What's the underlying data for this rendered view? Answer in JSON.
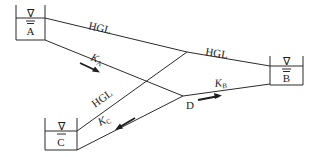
{
  "diagram": {
    "reservoirs": [
      {
        "id": "A",
        "label": "A"
      },
      {
        "id": "B",
        "label": "B"
      },
      {
        "id": "C",
        "label": "C"
      }
    ],
    "junction": {
      "label": "D"
    },
    "hgl_labels": {
      "a": "HGL",
      "b": "HGL",
      "c": "HGL"
    },
    "pipes": [
      {
        "from": "A",
        "to": "D",
        "label_main": "K",
        "label_sub": "A",
        "flow": "A to D"
      },
      {
        "from": "D",
        "to": "B",
        "label_main": "K",
        "label_sub": "B",
        "flow": "D to B"
      },
      {
        "from": "D",
        "to": "C",
        "label_main": "K",
        "label_sub": "C",
        "flow": "D to C"
      }
    ],
    "water_surface_symbol": "∇"
  }
}
